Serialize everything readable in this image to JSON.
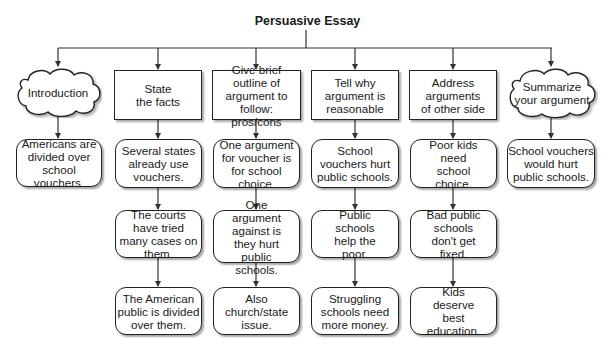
{
  "title": "Persuasive Essay",
  "columns": [
    {
      "header": {
        "text": "Introduction",
        "shape": "cloud"
      },
      "items": [
        "Americans are divided over school vouchers."
      ]
    },
    {
      "header": {
        "text": "State the facts",
        "shape": "rect"
      },
      "items": [
        "Several states already use vouchers.",
        "The courts have tried many cases on them.",
        "The American public is divided over them."
      ]
    },
    {
      "header": {
        "text": "Give brief outline of argument to follow: pros/cons",
        "shape": "rect"
      },
      "items": [
        "One argument for voucher is for school choice.",
        "One argument against is they hurt public schools.",
        "Also church/state issue."
      ]
    },
    {
      "header": {
        "text": "Tell why argument is reasonable",
        "shape": "rect"
      },
      "items": [
        "School vouchers hurt public schools.",
        "Public schools help the poor.",
        "Struggling schools need more money."
      ]
    },
    {
      "header": {
        "text": "Address arguments of other side",
        "shape": "rect"
      },
      "items": [
        "Poor kids need school choice.",
        "Bad public schools don't get fixed.",
        "Kids deserve best education."
      ]
    },
    {
      "header": {
        "text": "Summarize your argument",
        "shape": "cloud"
      },
      "items": [
        "School vouchers would hurt public schools."
      ]
    }
  ],
  "colors": {
    "line": "#333333",
    "border": "#222222",
    "background": "#ffffff"
  }
}
